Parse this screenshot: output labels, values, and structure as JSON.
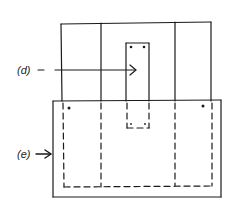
{
  "diagram": {
    "labels": {
      "d": "(d)",
      "e": "(e)"
    },
    "colors": {
      "stroke": "#1a1a1a",
      "background": "#ffffff"
    },
    "upper_frame": {
      "x": 61,
      "y": 23,
      "w": 150,
      "h": 78,
      "dividers_x": [
        101,
        175
      ]
    },
    "inner_slot": {
      "x": 126,
      "y": 43,
      "w": 23,
      "solid_bottom": 101,
      "dashed_bottom": 128
    },
    "lower_frame": {
      "x": 53,
      "y": 100,
      "w": 168,
      "h": 97
    },
    "dashed_outline": {
      "left": 63,
      "right": 212,
      "bottom": 187,
      "dividers_x": [
        101,
        175
      ]
    }
  }
}
